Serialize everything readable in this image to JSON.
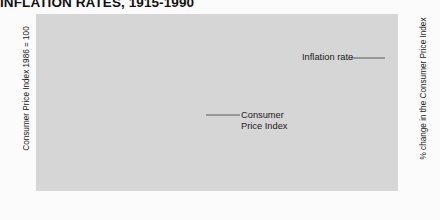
{
  "title": "INFLATION RATES, 1915-1990",
  "axes": {
    "left_title": "Consumer Price Index 1986 = 100",
    "right_title": "% change in the Consumer Price Index",
    "left_ticks": [
      10,
      30,
      50,
      70,
      90,
      110
    ],
    "right_ticks": [
      2,
      4,
      6,
      8,
      10,
      12
    ],
    "x_ticks": [
      1915,
      1925,
      1935,
      1945,
      1955,
      1965,
      1975,
      1985,
      1990
    ]
  },
  "annotations": {
    "inflation_rate": "Inflation rate",
    "cpi_line1": "Consumer",
    "cpi_line2": "Price Index"
  },
  "colors": {
    "plot_background": "#d6d6d6",
    "gridline": "#fafafa",
    "cpi_series": "#111111",
    "inflation_series": "#6e6e6e",
    "page_background": "#fbfbfb",
    "text": "#1a1a1a"
  },
  "chart_data": {
    "type": "line",
    "title": "INFLATION RATES, 1915-1990",
    "xlabel": "",
    "ylabel": "Consumer Price Index 1986 = 100",
    "ylabel_right": "% change in the Consumer Price Index",
    "xlim": [
      1915,
      1990
    ],
    "ylim": [
      0,
      110
    ],
    "ylim_right": [
      -1.2,
      13.4
    ],
    "grid": true,
    "legend": "annotated-inline",
    "series": [
      {
        "name": "Consumer Price Index",
        "axis": "right",
        "color": "#111111",
        "units": "% change",
        "x": [
          1915,
          1920,
          1925,
          1930,
          1935,
          1940,
          1945,
          1948,
          1950,
          1952,
          1954,
          1956,
          1958,
          1960,
          1963,
          1966,
          1969,
          1971,
          1973,
          1975,
          1977,
          1979,
          1981,
          1983,
          1985,
          1987,
          1989,
          1990
        ],
        "values": [
          -1.1,
          12.6,
          1.5,
          1.1,
          1.0,
          1.2,
          3.3,
          2.3,
          4.9,
          1.4,
          -1.2,
          1.3,
          2.0,
          1.4,
          1.9,
          3.9,
          4.6,
          3.0,
          7.6,
          10.8,
          8.0,
          9.2,
          12.5,
          5.8,
          4.0,
          4.4,
          5.0,
          4.8
        ]
      },
      {
        "name": "Inflation rate",
        "axis": "left",
        "color": "#6e6e6e",
        "units": "index (1986 = 100)",
        "x": [
          1915,
          1920,
          1925,
          1930,
          1935,
          1940,
          1945,
          1950,
          1955,
          1960,
          1965,
          1970,
          1975,
          1980,
          1985,
          1990
        ],
        "values": [
          11,
          18,
          16,
          16,
          15,
          16,
          19,
          24,
          27,
          29,
          32,
          38,
          53,
          75,
          93,
          110
        ]
      }
    ]
  }
}
